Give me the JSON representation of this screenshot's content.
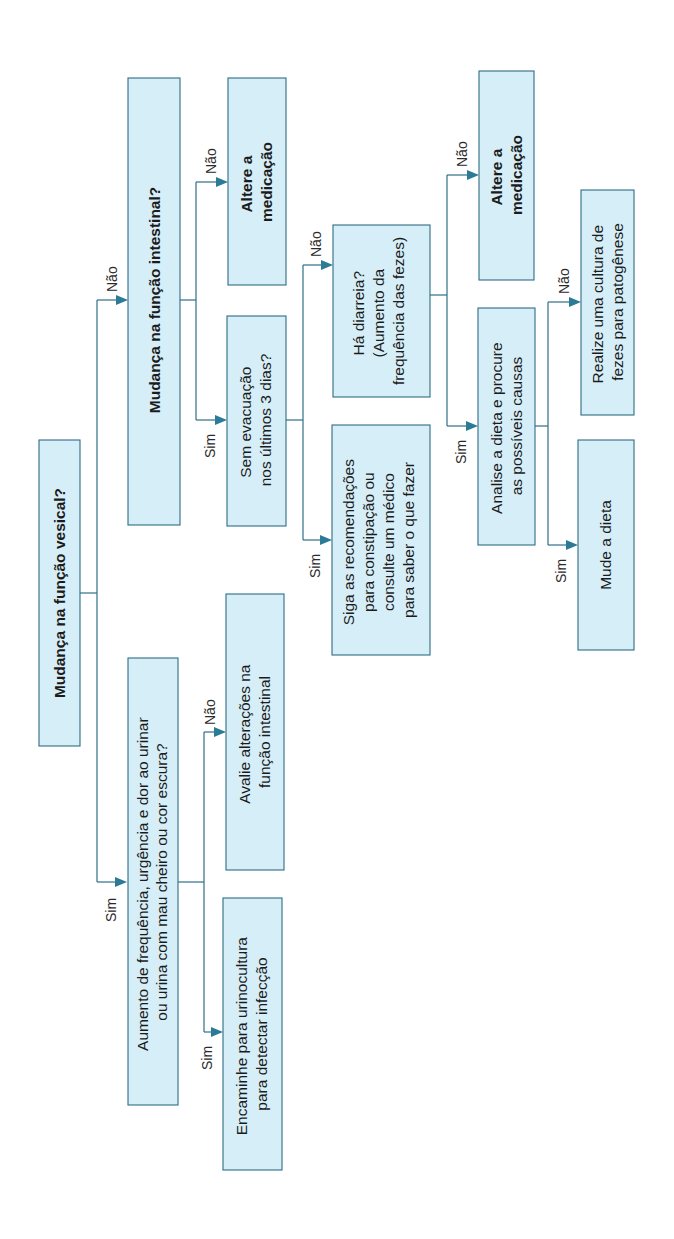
{
  "diagram": {
    "orientation": "rotated -90deg",
    "colors": {
      "box_fill": "#d6eef7",
      "box_border": "#2f6d86",
      "connector": "#2f6d86",
      "arrowhead": "#2b7a96"
    },
    "nodes": {
      "root": {
        "lines": [
          "Mudança na função vesical?"
        ],
        "bold": true
      },
      "urinary_question": {
        "lines": [
          "Aumento de frequência, urgência e dor ao urinar",
          "ou urina com mau cheiro ou cor escura?"
        ]
      },
      "refer_urine_culture": {
        "lines": [
          "Encaminhe para urinocultura",
          "para detectar infecção"
        ]
      },
      "evaluate_bowel": {
        "lines": [
          "Avalie alterações na",
          "função intestinal"
        ]
      },
      "bowel_question": {
        "lines": [
          "Mudança na função intestinal?"
        ],
        "bold": true
      },
      "no_evacuation": {
        "lines": [
          "Sem evacuação",
          "nos últimos 3 dias?"
        ]
      },
      "change_medication_1": {
        "lines": [
          "Altere a",
          "medicação"
        ],
        "bold": true
      },
      "constipation_advice": {
        "lines": [
          "Siga as recomendações",
          "para constipação ou",
          "consulte um médico",
          "para saber o que fazer"
        ]
      },
      "diarrhea_question": {
        "lines": [
          "Há diarreia?",
          "(Aumento da",
          "frequência das fezes)"
        ]
      },
      "analyze_diet": {
        "lines": [
          "Analise a dieta e procure",
          "as possíveis causas"
        ]
      },
      "change_medication_2": {
        "lines": [
          "Altere a",
          "medicação"
        ],
        "bold": true
      },
      "change_diet": {
        "lines": [
          "Mude a dieta"
        ]
      },
      "stool_culture": {
        "lines": [
          "Realize uma cultura de",
          "fezes para patogênese"
        ]
      }
    },
    "edge_labels": {
      "yes": "Sim",
      "no": "Não"
    },
    "edges": [
      {
        "from": "root",
        "to": "urinary_question",
        "label": "Sim"
      },
      {
        "from": "root",
        "to": "bowel_question",
        "label": "Não"
      },
      {
        "from": "urinary_question",
        "to": "refer_urine_culture",
        "label": "Sim"
      },
      {
        "from": "urinary_question",
        "to": "evaluate_bowel",
        "label": "Não"
      },
      {
        "from": "bowel_question",
        "to": "no_evacuation",
        "label": "Sim"
      },
      {
        "from": "bowel_question",
        "to": "change_medication_1",
        "label": "Não"
      },
      {
        "from": "no_evacuation",
        "to": "constipation_advice",
        "label": "Sim"
      },
      {
        "from": "no_evacuation",
        "to": "diarrhea_question",
        "label": "Não"
      },
      {
        "from": "diarrhea_question",
        "to": "analyze_diet",
        "label": "Sim"
      },
      {
        "from": "diarrhea_question",
        "to": "change_medication_2",
        "label": "Não"
      },
      {
        "from": "analyze_diet",
        "to": "change_diet",
        "label": "Sim"
      },
      {
        "from": "analyze_diet",
        "to": "stool_culture",
        "label": "Não"
      }
    ]
  }
}
